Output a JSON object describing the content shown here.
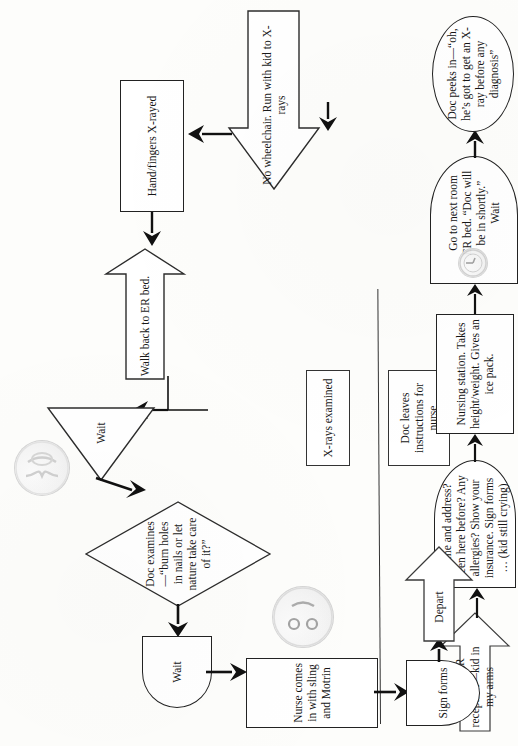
{
  "document": {
    "type": "flowchart",
    "title": "Emergency Room visit process flowchart",
    "orientation": "rotated-90-ccw",
    "ink_color": "#151515",
    "paper_color": "#fdfdfb"
  },
  "top_band": {
    "separator": "horizontal rule",
    "boxes": [
      {
        "id": "xrays-examined",
        "label": "X-rays examined"
      },
      {
        "id": "doc-leaves-instructions",
        "label": "Doc leaves instructions for nurse"
      }
    ]
  },
  "nodes": [
    {
      "id": "run-into-er",
      "shape": "block-arrow-up",
      "label": "Run into ER reception—kid in my arms"
    },
    {
      "id": "name-and-address",
      "shape": "delay",
      "label": "Name and address? Been here before? Any allergies? Show your insurance. Sign forms … (kid still crying)"
    },
    {
      "id": "nursing-station",
      "shape": "process",
      "label": "Nursing station. Takes height/weight. Gives an ice pack."
    },
    {
      "id": "go-to-next-room",
      "shape": "delay",
      "label": "Go to next room ER bed. “Doc will be in shortly.” Wait"
    },
    {
      "id": "doc-peeks-in",
      "shape": "ellipse",
      "label": "Doc peeks in—“oh, he’s got to get an X-ray before any diagnosis”"
    },
    {
      "id": "no-wheelchair",
      "shape": "block-arrow-right",
      "label": "No wheelchair. Run with kid to X-rays"
    },
    {
      "id": "hand-fingers-xrayed",
      "shape": "process",
      "label": "Hand/fingers X-rayed"
    },
    {
      "id": "walk-back-to-er-bed",
      "shape": "block-arrow-up",
      "label": "Walk back to ER bed."
    },
    {
      "id": "wait-triangle",
      "shape": "triangle",
      "label": "Wait"
    },
    {
      "id": "doc-examines",
      "shape": "decision",
      "label": "Doc examines—“burn holes in nails or let nature take care of it?”"
    },
    {
      "id": "wait-delay",
      "shape": "delay",
      "label": "Wait"
    },
    {
      "id": "nurse-comes-in",
      "shape": "process",
      "label": "Nurse comes in with sling and Motrin"
    },
    {
      "id": "sign-forms",
      "shape": "delay",
      "label": "Sign forms"
    },
    {
      "id": "depart",
      "shape": "block-arrow-right",
      "label": "Depart"
    }
  ],
  "clipart": [
    {
      "id": "frowning-face",
      "kind": "sad-face-icon",
      "near": "name-and-address"
    },
    {
      "id": "clock-small",
      "kind": "clock-icon",
      "near": "go-to-next-room"
    },
    {
      "id": "hourglass",
      "kind": "hourglass-icon",
      "near": "wait-triangle"
    },
    {
      "id": "smiling-face",
      "kind": "smiley-face-icon",
      "near": "nurse-comes-in"
    }
  ],
  "connectors": [
    {
      "from": "run-into-er",
      "to": "name-and-address"
    },
    {
      "from": "name-and-address",
      "to": "nursing-station"
    },
    {
      "from": "nursing-station",
      "to": "go-to-next-room"
    },
    {
      "from": "go-to-next-room",
      "to": "doc-peeks-in"
    },
    {
      "from": "doc-peeks-in",
      "to": "no-wheelchair"
    },
    {
      "from": "no-wheelchair",
      "to": "hand-fingers-xrayed"
    },
    {
      "from": "hand-fingers-xrayed",
      "to": "walk-back-to-er-bed"
    },
    {
      "from": "walk-back-to-er-bed",
      "to": "wait-triangle"
    },
    {
      "from": "wait-triangle",
      "to": "doc-examines"
    },
    {
      "from": "doc-examines",
      "to": "wait-delay"
    },
    {
      "from": "wait-delay",
      "to": "nurse-comes-in"
    },
    {
      "from": "nurse-comes-in",
      "to": "sign-forms"
    },
    {
      "from": "sign-forms",
      "to": "depart"
    }
  ]
}
